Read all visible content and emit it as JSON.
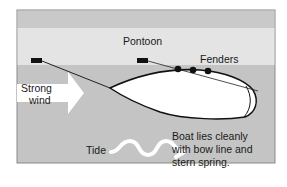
{
  "diagram": {
    "labels": {
      "pontoon": "Pontoon",
      "fenders": "Fenders",
      "wind_line1": "Strong",
      "wind_line2": "wind",
      "tide": "Tide",
      "caption_line1": "Boat lies cleanly",
      "caption_line2": "with bow line and",
      "caption_line3": "stern spring."
    },
    "colors": {
      "top_band": "#c9c9c9",
      "pontoon": "#e4e4e4",
      "water": "#c4c4c4",
      "boat": "#ffffff",
      "outline": "#111111",
      "arrow": "#ffffff"
    },
    "fender_count": 3
  }
}
